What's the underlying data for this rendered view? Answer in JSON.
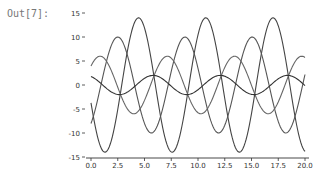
{
  "cell": {
    "prompt": "Out[7]:"
  },
  "chart_data": {
    "type": "line",
    "title": "",
    "xlabel": "",
    "ylabel": "",
    "xlim": [
      0,
      20
    ],
    "ylim": [
      -15,
      15
    ],
    "grid": false,
    "legend": null,
    "xticks": [
      0.0,
      2.5,
      5.0,
      7.5,
      10.0,
      12.5,
      15.0,
      17.5,
      20.0
    ],
    "xtick_labels": [
      "0.0",
      "2.5",
      "5.0",
      "7.5",
      "10.0",
      "12.5",
      "15.0",
      "17.5",
      "20.0"
    ],
    "yticks": [
      15,
      10,
      5,
      0,
      -5,
      -10,
      -15
    ],
    "ytick_labels": [
      "15",
      "10",
      "5",
      "0",
      "-5",
      "-10",
      "-15"
    ],
    "series": [
      {
        "name": "amplitude 14",
        "amplitude": 14,
        "phase": 3.41,
        "color": "#444444"
      },
      {
        "name": "amplitude 10",
        "amplitude": 10,
        "phase": -0.93,
        "color": "#555555"
      },
      {
        "name": "amplitude 6",
        "amplitude": 6,
        "phase": 0.72,
        "color": "#666666"
      },
      {
        "name": "amplitude 2",
        "amplitude": 2,
        "phase": 2.05,
        "color": "#333333"
      }
    ],
    "function": "amplitude * sin(x + phase)"
  }
}
